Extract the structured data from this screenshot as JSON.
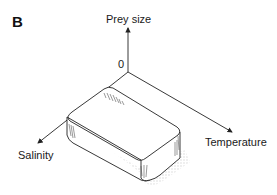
{
  "figure": {
    "panel_label": "B",
    "origin_label": "0",
    "axes": {
      "vertical": "Prey size",
      "right": "Temperature",
      "left": "Salinity"
    },
    "shape": "rounded rectangular block representing niche volume",
    "colors": {
      "line": "#222222",
      "shadow": "#d8d8d8",
      "hatch": "#555555"
    }
  }
}
